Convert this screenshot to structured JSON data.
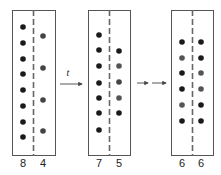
{
  "diagram": {
    "arrow_label": "t",
    "colors": {
      "dot_dark": "#1a1a1a",
      "dot_gray": "#555555",
      "border": "#555555"
    },
    "panels": [
      {
        "id": "initial",
        "left_count": "8",
        "right_count": "4",
        "left_dots": 8,
        "right_dots": 4
      },
      {
        "id": "intermediate",
        "left_count": "7",
        "right_count": "5",
        "left_dots": 7,
        "right_dots": 5
      },
      {
        "id": "equilibrium",
        "left_count": "6",
        "right_count": "6",
        "left_dots": 6,
        "right_dots": 6
      }
    ]
  }
}
